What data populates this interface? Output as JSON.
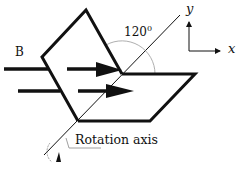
{
  "diagram": {
    "field_label": "B",
    "angle_label": "120",
    "angle_superscript": "0",
    "axis_caption": "Rotation axis",
    "coord_axes": {
      "y_label": "y",
      "x_label": "x"
    },
    "colors": {
      "stroke": "#111111",
      "arc": "#999999",
      "background": "#ffffff"
    }
  }
}
